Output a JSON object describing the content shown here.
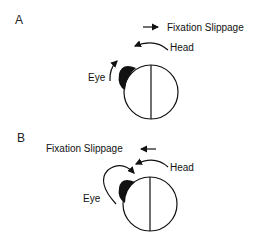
{
  "panels": [
    {
      "id": "A",
      "label": "A",
      "fixation_label": "Fixation Slippage",
      "fixation_direction": "right",
      "head_label": "Head",
      "head_direction": "left",
      "eye_label": "Eye",
      "eye_direction": "up"
    },
    {
      "id": "B",
      "label": "B",
      "fixation_label": "Fixation Slippage",
      "fixation_direction": "left",
      "head_label": "Head",
      "head_direction": "left",
      "eye_label": "Eye",
      "eye_direction": "large loop up-over toward head"
    }
  ],
  "colors": {
    "ink": "#111111",
    "background": "#ffffff"
  }
}
